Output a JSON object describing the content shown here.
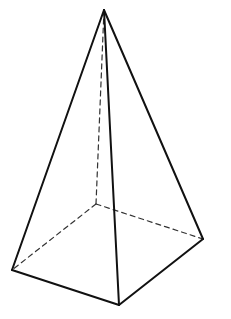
{
  "diagram": {
    "background": "#ffffff",
    "stroke_color": "#111111",
    "dash_color": "#333333",
    "vertices": {
      "apex": [
        104,
        10
      ],
      "front_left": [
        12,
        270
      ],
      "front_bottom": [
        119,
        305
      ],
      "front_right": [
        203,
        239
      ],
      "back_hidden": [
        96,
        204
      ]
    },
    "visible_edges": [
      [
        "apex",
        "front_left"
      ],
      [
        "apex",
        "front_bottom"
      ],
      [
        "apex",
        "front_right"
      ],
      [
        "front_left",
        "front_bottom"
      ],
      [
        "front_bottom",
        "front_right"
      ]
    ],
    "hidden_edges": [
      [
        "apex",
        "back_hidden"
      ],
      [
        "back_hidden",
        "front_left"
      ],
      [
        "back_hidden",
        "front_right"
      ]
    ]
  }
}
